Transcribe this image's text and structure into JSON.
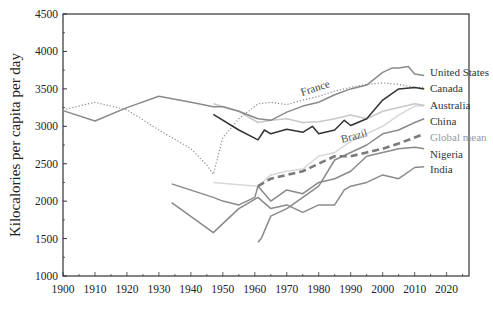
{
  "chart_data": {
    "type": "line",
    "title": "",
    "xlabel": "",
    "ylabel": "Kilocalories per capita per day",
    "xlim": [
      1900,
      2027
    ],
    "ylim": [
      1000,
      4500
    ],
    "x_ticks": [
      1900,
      1910,
      1920,
      1930,
      1940,
      1950,
      1960,
      1970,
      1980,
      1990,
      2000,
      2010,
      2020
    ],
    "y_ticks": [
      1000,
      1500,
      2000,
      2500,
      3000,
      3500,
      4000,
      4500
    ],
    "grid": false,
    "legend_position": "direct labels at line ends",
    "series": [
      {
        "name": "United States",
        "color": "#8a8a8a",
        "style": "solid",
        "x": [
          1900,
          1910,
          1920,
          1930,
          1940,
          1947,
          1950,
          1955,
          1961,
          1965,
          1970,
          1975,
          1980,
          1985,
          1990,
          1995,
          2000,
          2003,
          2005,
          2008,
          2010,
          2013
        ],
        "y": [
          3210,
          3070,
          3250,
          3400,
          3320,
          3260,
          3260,
          3200,
          3100,
          3080,
          3190,
          3270,
          3320,
          3420,
          3500,
          3550,
          3720,
          3780,
          3780,
          3800,
          3700,
          3680
        ]
      },
      {
        "name": "France",
        "color": "#8a8a8a",
        "style": "dotted",
        "x": [
          1900,
          1910,
          1920,
          1930,
          1940,
          1945,
          1947,
          1950,
          1955,
          1961,
          1965,
          1970,
          1975,
          1980,
          1985,
          1990,
          1995,
          2000,
          2005,
          2010,
          2013
        ],
        "y": [
          3220,
          3320,
          3220,
          2950,
          2700,
          2480,
          2360,
          2850,
          3100,
          3300,
          3320,
          3290,
          3350,
          3400,
          3470,
          3520,
          3560,
          3580,
          3560,
          3520,
          3520
        ]
      },
      {
        "name": "Canada",
        "color": "#333333",
        "style": "solid",
        "x": [
          1947,
          1955,
          1961,
          1963,
          1965,
          1970,
          1975,
          1978,
          1980,
          1985,
          1988,
          1990,
          1995,
          2000,
          2005,
          2010,
          2013
        ],
        "y": [
          3160,
          2950,
          2820,
          2950,
          2900,
          2960,
          2920,
          3000,
          2900,
          2950,
          3080,
          3010,
          3100,
          3350,
          3500,
          3520,
          3500
        ]
      },
      {
        "name": "Australia",
        "color": "#c8c8c8",
        "style": "solid",
        "x": [
          1947,
          1955,
          1961,
          1965,
          1970,
          1975,
          1980,
          1985,
          1990,
          1995,
          2000,
          2005,
          2010,
          2013
        ],
        "y": [
          3300,
          3200,
          3050,
          3080,
          3100,
          3050,
          3060,
          3100,
          3150,
          3100,
          3200,
          3250,
          3300,
          3280
        ]
      },
      {
        "name": "Brazil",
        "color": "#d8d8d8",
        "style": "solid",
        "x": [
          1947,
          1955,
          1961,
          1965,
          1970,
          1975,
          1980,
          1985,
          1990,
          1995,
          2000,
          2005,
          2010,
          2013
        ],
        "y": [
          2250,
          2220,
          2200,
          2350,
          2400,
          2430,
          2600,
          2650,
          2800,
          2900,
          3000,
          3150,
          3270,
          3270
        ]
      },
      {
        "name": "China",
        "color": "#8a8a8a",
        "style": "solid",
        "x": [
          1961,
          1962,
          1965,
          1970,
          1975,
          1980,
          1985,
          1990,
          1995,
          2000,
          2005,
          2010,
          2013
        ],
        "y": [
          1450,
          1500,
          1800,
          1900,
          2050,
          2200,
          2550,
          2650,
          2750,
          2900,
          2950,
          3050,
          3100
        ]
      },
      {
        "name": "Global mean",
        "color": "#7a7a7a",
        "style": "dashed",
        "x": [
          1961,
          1965,
          1970,
          1975,
          1980,
          1985,
          1990,
          1995,
          2000,
          2005,
          2010,
          2013
        ],
        "y": [
          2200,
          2300,
          2350,
          2400,
          2500,
          2600,
          2600,
          2650,
          2700,
          2770,
          2850,
          2900
        ]
      },
      {
        "name": "Nigeria",
        "color": "#8a8a8a",
        "style": "solid",
        "x": [
          1934,
          1947,
          1950,
          1955,
          1960,
          1961,
          1965,
          1970,
          1975,
          1980,
          1985,
          1990,
          1995,
          2000,
          2005,
          2010,
          2013
        ],
        "y": [
          2230,
          2050,
          2000,
          1950,
          2050,
          2200,
          2000,
          2150,
          2100,
          2250,
          2300,
          2400,
          2600,
          2650,
          2700,
          2720,
          2700
        ]
      },
      {
        "name": "India",
        "color": "#8a8a8a",
        "style": "solid",
        "x": [
          1934,
          1947,
          1950,
          1955,
          1961,
          1965,
          1970,
          1975,
          1980,
          1985,
          1988,
          1990,
          1995,
          2000,
          2005,
          2010,
          2013
        ],
        "y": [
          1980,
          1580,
          1700,
          1900,
          2050,
          1900,
          1950,
          1850,
          1950,
          1950,
          2150,
          2200,
          2250,
          2350,
          2300,
          2450,
          2460
        ]
      }
    ],
    "annotations": [
      {
        "text": "France",
        "x": 1969,
        "y": 3390
      },
      {
        "text": "Brazil",
        "x": 1984,
        "y": 2760
      }
    ]
  },
  "labels": {
    "ylabel": "Kilocalories per capita per day",
    "france": "France",
    "brazil": "Brazil",
    "end_labels": [
      "United States",
      "Canada",
      "Australia",
      "China",
      "Global mean",
      "Nigeria",
      "India"
    ]
  }
}
